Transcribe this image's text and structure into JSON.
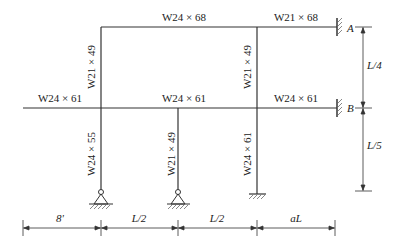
{
  "diagram": {
    "type": "structural-frame",
    "members": {
      "top_beam_left": "W24 × 68",
      "top_beam_right": "W21 × 68",
      "mid_beam_cantilever": "W24 × 61",
      "mid_beam_center": "W24 × 61",
      "mid_beam_right": "W24 × 61",
      "upper_col_left": "W21 × 49",
      "upper_col_right": "W21 × 49",
      "lower_col_left": "W24 × 55",
      "lower_col_mid": "W21 × 49",
      "lower_col_right": "W24 × 61"
    },
    "supports": {
      "A": "A",
      "B": "B"
    },
    "dimensions": {
      "vertical_top": "L/4",
      "vertical_bottom": "L/5",
      "horizontal": [
        "8'",
        "L/2",
        "L/2",
        "aL"
      ]
    }
  }
}
